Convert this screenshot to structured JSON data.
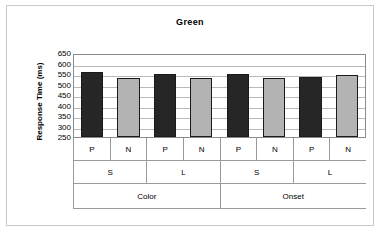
{
  "chart_data": {
    "type": "bar",
    "title": "Green",
    "xlabel": "",
    "ylabel": "Response Time (ms)",
    "ylim": [
      250,
      650
    ],
    "ytick_step": 50,
    "yticks": [
      650,
      600,
      550,
      500,
      450,
      400,
      350,
      300,
      250
    ],
    "grid": true,
    "legend": "none",
    "categories": [
      "P",
      "N",
      "P",
      "N",
      "P",
      "N",
      "P",
      "N"
    ],
    "group_level_2": [
      "S",
      "L",
      "S",
      "L"
    ],
    "group_level_3": [
      "Color",
      "Onset"
    ],
    "values": [
      560,
      530,
      550,
      530,
      548,
      530,
      535,
      543
    ],
    "bars": [
      {
        "label": "P",
        "sublabel": "S",
        "group": "Color",
        "value": 560,
        "color": "#262626"
      },
      {
        "label": "N",
        "sublabel": "S",
        "group": "Color",
        "value": 530,
        "color": "#b3b3b3"
      },
      {
        "label": "P",
        "sublabel": "L",
        "group": "Color",
        "value": 550,
        "color": "#262626"
      },
      {
        "label": "N",
        "sublabel": "L",
        "group": "Color",
        "value": 530,
        "color": "#b3b3b3"
      },
      {
        "label": "P",
        "sublabel": "S",
        "group": "Onset",
        "value": 548,
        "color": "#262626"
      },
      {
        "label": "N",
        "sublabel": "S",
        "group": "Onset",
        "value": 530,
        "color": "#b3b3b3"
      },
      {
        "label": "P",
        "sublabel": "L",
        "group": "Onset",
        "value": 535,
        "color": "#262626"
      },
      {
        "label": "N",
        "sublabel": "L",
        "group": "Onset",
        "value": 543,
        "color": "#b3b3b3"
      }
    ],
    "colors": {
      "bar_dark": "#262626",
      "bar_light": "#b3b3b3",
      "bar_outline": "#1a1a1a",
      "gridline": "#b9b9b9",
      "axis": "#8a8a8a",
      "frame": "#c9c9c9",
      "text": "#000000",
      "background": "#ffffff"
    }
  }
}
